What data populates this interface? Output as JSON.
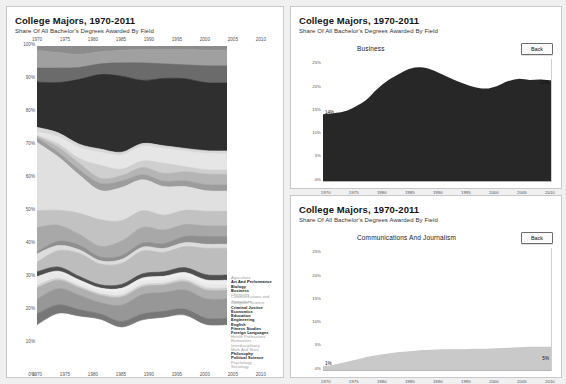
{
  "left": {
    "title": "College Majors, 1970-2011",
    "subtitle": "Share Of All Bachelor's Degrees Awarded By Field",
    "y_ticks": [
      "100%",
      "90%",
      "80%",
      "70%",
      "60%",
      "50%",
      "40%",
      "30%",
      "20%",
      "10%",
      "0%"
    ],
    "x_ticks": [
      "1970",
      "1975",
      "1980",
      "1985",
      "1990",
      "1995",
      "2000",
      "2005",
      "2010"
    ],
    "legend": [
      "Agriculture",
      "Art And Performance",
      "Biology",
      "Business",
      "Chemistry",
      "Communications and Journalism",
      "Computer Science",
      "Criminal Justice",
      "Economics",
      "Education",
      "Engineering",
      "English",
      "Fitness Studies",
      "Foreign Languages",
      "Health Professions",
      "Humanities",
      "Interdisciplinary",
      "Math And Stats",
      "Philosophy",
      "Political Science",
      "Psychology",
      "Sociology"
    ]
  },
  "business": {
    "title": "College Majors, 1970-2011",
    "subtitle": "Share Of All Bachelor's Degrees Awarded By Field",
    "series_name": "Business",
    "back_label": "Back",
    "start_label": "14%",
    "end_label": "21%",
    "y_ticks": [
      "25%",
      "20%",
      "15%",
      "10%",
      "5%",
      "0%"
    ],
    "x_ticks": [
      "1970",
      "1975",
      "1980",
      "1985",
      "1990",
      "1995",
      "2000",
      "2005",
      "2010"
    ]
  },
  "comms": {
    "title": "College Majors, 1970-2011",
    "subtitle": "Share Of All Bachelor's Degrees Awarded By Field",
    "series_name": "Communications And Journalism",
    "back_label": "Back",
    "start_label": "1%",
    "end_label": "5%",
    "y_ticks": [
      "25%",
      "20%",
      "15%",
      "10%",
      "5%",
      "0%"
    ],
    "x_ticks": [
      "1970",
      "1975",
      "1980",
      "1985",
      "1990",
      "1995",
      "2000",
      "2005",
      "2010"
    ]
  },
  "chart_data": [
    {
      "type": "area",
      "id": "stacked-majors",
      "title": "College Majors, 1970-2011",
      "subtitle": "Share Of All Bachelor's Degrees Awarded By Field",
      "xlabel": "",
      "ylabel": "",
      "x": [
        1970,
        1975,
        1980,
        1985,
        1990,
        1995,
        2000,
        2005,
        2010,
        2011
      ],
      "ylim": [
        0,
        100
      ],
      "grid": false,
      "legend_position": "right",
      "stacked": true,
      "series": [
        {
          "name": "Agriculture",
          "color": "#8c8c8c",
          "values": [
            1.4,
            2.0,
            2.6,
            1.8,
            1.3,
            1.1,
            1.1,
            1.1,
            1.3,
            1.3
          ]
        },
        {
          "name": "Art And Performance",
          "color": "#a0a0a0",
          "values": [
            5.4,
            4.8,
            4.0,
            3.7,
            3.9,
            4.1,
            4.4,
            4.7,
            4.8,
            4.8
          ]
        },
        {
          "name": "Biology",
          "color": "#6b6b6b",
          "values": [
            4.3,
            4.5,
            3.7,
            3.3,
            4.1,
            5.4,
            4.5,
            4.3,
            5.2,
            5.3
          ]
        },
        {
          "name": "Business",
          "color": "#2f2f2f",
          "values": [
            14.0,
            15.5,
            20.0,
            23.0,
            23.5,
            19.5,
            20.8,
            21.5,
            21.0,
            21.0
          ]
        },
        {
          "name": "Chemistry",
          "color": "#d8d8d8",
          "values": [
            1.5,
            1.2,
            1.1,
            1.0,
            0.9,
            0.9,
            0.8,
            0.8,
            0.9,
            0.9
          ]
        },
        {
          "name": "Communications and Journalism",
          "color": "#e6e6e6",
          "values": [
            1.0,
            2.2,
            3.3,
            4.0,
            4.3,
            4.5,
            4.6,
            4.8,
            5.0,
            5.0
          ]
        },
        {
          "name": "Computer Science",
          "color": "#cfcfcf",
          "values": [
            0.3,
            1.0,
            1.5,
            4.0,
            2.0,
            2.0,
            3.1,
            1.6,
            1.3,
            1.3
          ]
        },
        {
          "name": "Criminal Justice",
          "color": "#b5b5b5",
          "values": [
            0.5,
            1.6,
            2.0,
            1.6,
            1.7,
            2.2,
            2.4,
            2.8,
            3.3,
            3.3
          ]
        },
        {
          "name": "Economics",
          "color": "#9d9d9d",
          "values": [
            1.4,
            1.4,
            1.6,
            2.2,
            2.0,
            1.6,
            1.7,
            1.8,
            1.9,
            1.9
          ]
        },
        {
          "name": "Education",
          "color": "#e0e0e0",
          "values": [
            21.0,
            16.5,
            11.8,
            9.0,
            10.2,
            9.5,
            8.8,
            7.3,
            6.3,
            6.2
          ]
        },
        {
          "name": "Engineering",
          "color": "#c2c2c2",
          "values": [
            5.2,
            4.6,
            6.5,
            8.2,
            6.3,
            5.2,
            4.6,
            4.4,
            4.5,
            4.5
          ]
        },
        {
          "name": "English",
          "color": "#a8a8a8",
          "values": [
            7.6,
            5.0,
            3.4,
            3.3,
            4.5,
            4.8,
            4.2,
            3.7,
            3.3,
            3.3
          ]
        },
        {
          "name": "Fitness Studies",
          "color": "#8f8f8f",
          "values": [
            0.6,
            1.3,
            1.4,
            1.2,
            1.2,
            1.3,
            1.5,
            1.9,
            2.4,
            2.4
          ]
        },
        {
          "name": "Foreign Languages",
          "color": "#dcdcdc",
          "values": [
            2.5,
            1.6,
            1.1,
            1.0,
            1.2,
            1.2,
            1.2,
            1.2,
            1.2,
            1.2
          ]
        },
        {
          "name": "Health Professions",
          "color": "#bdbdbd",
          "values": [
            3.0,
            5.0,
            7.1,
            6.4,
            6.5,
            7.0,
            6.0,
            6.5,
            8.2,
            8.3
          ]
        },
        {
          "name": "Humanities",
          "color": "#4f4f4f",
          "values": [
            1.5,
            1.3,
            1.1,
            1.0,
            1.2,
            1.3,
            1.4,
            1.5,
            1.6,
            1.6
          ]
        },
        {
          "name": "Interdisciplinary",
          "color": "#efefef",
          "values": [
            0.2,
            0.6,
            0.8,
            0.8,
            0.9,
            1.0,
            1.1,
            1.2,
            1.3,
            1.3
          ]
        },
        {
          "name": "Math And Stats",
          "color": "#e8e8e8",
          "values": [
            2.5,
            1.6,
            1.1,
            0.9,
            1.2,
            1.1,
            1.0,
            1.0,
            1.1,
            1.1
          ]
        },
        {
          "name": "Philosophy",
          "color": "#d0d0d0",
          "values": [
            0.8,
            0.6,
            0.5,
            0.5,
            0.6,
            0.6,
            0.6,
            0.6,
            0.7,
            0.7
          ]
        },
        {
          "name": "Political Science",
          "color": "#b0b0b0",
          "values": [
            3.5,
            2.6,
            2.3,
            2.3,
            2.5,
            2.4,
            2.3,
            2.6,
            2.7,
            2.7
          ]
        },
        {
          "name": "Psychology",
          "color": "#979797",
          "values": [
            4.5,
            5.0,
            4.5,
            3.5,
            5.0,
            6.0,
            5.8,
            5.9,
            6.0,
            6.0
          ]
        },
        {
          "name": "Sociology",
          "color": "#777777",
          "values": [
            3.3,
            2.6,
            1.9,
            1.6,
            1.7,
            1.8,
            1.8,
            1.8,
            1.9,
            1.9
          ]
        }
      ]
    },
    {
      "type": "area",
      "id": "business-share",
      "title": "College Majors, 1970-2011",
      "subtitle": "Share Of All Bachelor's Degrees Awarded By Field",
      "series_name": "Business",
      "color": "#272727",
      "xlabel": "",
      "ylabel": "",
      "ylim": [
        0,
        25
      ],
      "y_ticks": [
        0,
        5,
        10,
        15,
        20,
        25
      ],
      "grid": false,
      "x": [
        1970,
        1972,
        1974,
        1976,
        1978,
        1980,
        1982,
        1984,
        1986,
        1988,
        1990,
        1992,
        1994,
        1996,
        1998,
        2000,
        2002,
        2004,
        2006,
        2008,
        2010,
        2011
      ],
      "values": [
        14.0,
        14.2,
        14.6,
        15.6,
        17.0,
        19.2,
        21.0,
        22.3,
        23.4,
        23.7,
        23.2,
        22.2,
        21.2,
        20.3,
        19.6,
        19.3,
        19.8,
        20.8,
        21.3,
        21.1,
        21.2,
        21.0
      ],
      "annotations": [
        {
          "text": "14%",
          "x": 1970,
          "y": 14.0
        },
        {
          "text": "21%",
          "x": 2011,
          "y": 21.0
        }
      ]
    },
    {
      "type": "area",
      "id": "communications-share",
      "title": "College Majors, 1970-2011",
      "subtitle": "Share Of All Bachelor's Degrees Awarded By Field",
      "series_name": "Communications And Journalism",
      "color": "#c9c9c9",
      "xlabel": "",
      "ylabel": "",
      "ylim": [
        0,
        25
      ],
      "y_ticks": [
        0,
        5,
        10,
        15,
        20,
        25
      ],
      "grid": false,
      "x": [
        1970,
        1972,
        1974,
        1976,
        1978,
        1980,
        1982,
        1984,
        1986,
        1988,
        1990,
        1992,
        1994,
        1996,
        1998,
        2000,
        2002,
        2004,
        2006,
        2008,
        2010,
        2011
      ],
      "values": [
        1.0,
        1.3,
        1.8,
        2.3,
        2.9,
        3.3,
        3.6,
        3.9,
        4.1,
        4.3,
        4.4,
        4.5,
        4.5,
        4.5,
        4.6,
        4.6,
        4.7,
        4.8,
        4.9,
        5.0,
        5.0,
        5.0
      ],
      "annotations": [
        {
          "text": "1%",
          "x": 1970,
          "y": 1.0
        },
        {
          "text": "5%",
          "x": 2011,
          "y": 5.0
        }
      ]
    }
  ]
}
